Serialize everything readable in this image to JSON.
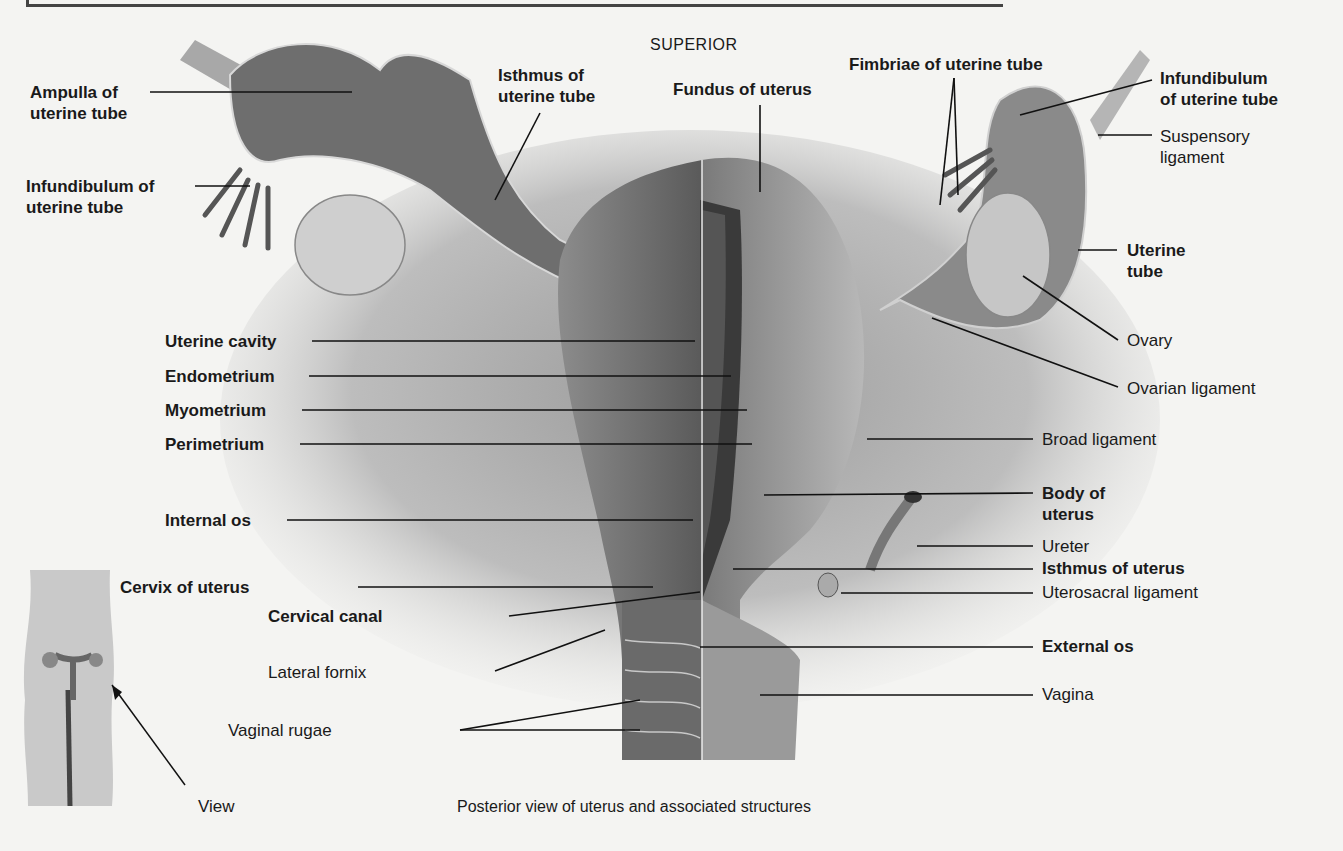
{
  "figure": {
    "orientation_label": "SUPERIOR",
    "caption": "Posterior view of uterus and associated structures",
    "inset": {
      "label": "View"
    }
  },
  "labels_left": [
    {
      "id": "ampulla",
      "line1": "Ampulla of",
      "line2": "uterine tube",
      "bold": true
    },
    {
      "id": "infundibulum-left",
      "line1": "Infundibulum of",
      "line2": "uterine tube",
      "bold": true
    },
    {
      "id": "isthmus-tube",
      "line1": "Isthmus of",
      "line2": "uterine tube",
      "bold": true
    },
    {
      "id": "uterine-cavity",
      "text": "Uterine cavity",
      "bold": true
    },
    {
      "id": "endometrium",
      "text": "Endometrium",
      "bold": true
    },
    {
      "id": "myometrium",
      "text": "Myometrium",
      "bold": true
    },
    {
      "id": "perimetrium",
      "text": "Perimetrium",
      "bold": true
    },
    {
      "id": "internal-os",
      "text": "Internal os",
      "bold": true
    },
    {
      "id": "cervix",
      "text": "Cervix of uterus",
      "bold": true
    },
    {
      "id": "cervical-canal",
      "text": "Cervical canal",
      "bold": true
    },
    {
      "id": "lateral-fornix",
      "text": "Lateral fornix",
      "bold": false
    },
    {
      "id": "vaginal-rugae",
      "text": "Vaginal rugae",
      "bold": false
    }
  ],
  "labels_right": [
    {
      "id": "fundus",
      "text": "Fundus of uterus",
      "bold": true
    },
    {
      "id": "fimbriae",
      "text": "Fimbriae of uterine tube",
      "bold": true
    },
    {
      "id": "infundibulum-right",
      "line1": "Infundibulum",
      "line2": "of uterine tube",
      "bold": true
    },
    {
      "id": "suspensory",
      "line1": "Suspensory",
      "line2": "ligament",
      "bold": false
    },
    {
      "id": "uterine-tube",
      "line1": "Uterine",
      "line2": "tube",
      "bold": true
    },
    {
      "id": "ovary",
      "text": "Ovary",
      "bold": false
    },
    {
      "id": "ovarian-ligament",
      "text": "Ovarian ligament",
      "bold": false
    },
    {
      "id": "broad-ligament",
      "text": "Broad ligament",
      "bold": false
    },
    {
      "id": "body-uterus",
      "line1": "Body of",
      "line2": "uterus",
      "bold": true
    },
    {
      "id": "ureter",
      "text": "Ureter",
      "bold": false
    },
    {
      "id": "isthmus-uterus",
      "text": "Isthmus of uterus",
      "bold": true
    },
    {
      "id": "uterosacral",
      "text": "Uterosacral ligament",
      "bold": false
    },
    {
      "id": "external-os",
      "text": "External os",
      "bold": true
    },
    {
      "id": "vagina",
      "text": "Vagina",
      "bold": false
    }
  ]
}
